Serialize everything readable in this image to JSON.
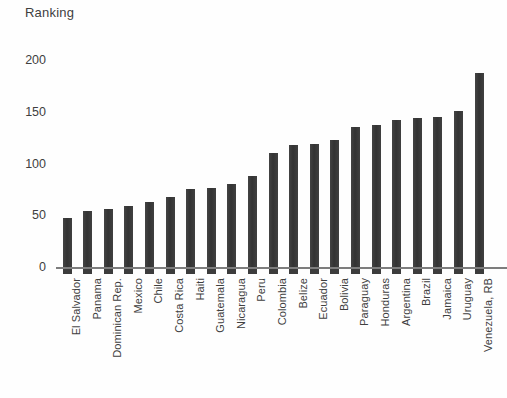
{
  "chart_data": {
    "type": "bar",
    "title": "Ranking",
    "xlabel": "",
    "ylabel": "Ranking",
    "ylim": [
      0,
      200
    ],
    "yticks": [
      0,
      50,
      100,
      150,
      200
    ],
    "grid": false,
    "legend": null,
    "bar_color": "#3c3c3c",
    "categories": [
      "El Salvador",
      "Panama",
      "Dominican Rep.",
      "Mexico",
      "Chile",
      "Costa Rica",
      "Haiti",
      "Guatemala",
      "Nicaragua",
      "Peru",
      "Colombia",
      "Belize",
      "Ecuador",
      "Bolivia",
      "Paraguay",
      "Honduras",
      "Argentina",
      "Brazil",
      "Jamaica",
      "Uruguay",
      "Venezuela, RB"
    ],
    "values": [
      48,
      55,
      57,
      60,
      64,
      69,
      76,
      77,
      81,
      89,
      111,
      119,
      120,
      124,
      136,
      138,
      143,
      145,
      146,
      152,
      188
    ]
  },
  "axis": {
    "y_tick_labels": [
      "200",
      "150",
      "100",
      "50",
      "0"
    ]
  }
}
